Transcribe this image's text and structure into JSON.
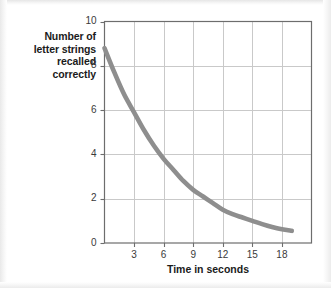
{
  "figure": {
    "y_axis_caption_lines": [
      "Number of",
      "letter strings",
      "recalled",
      "correctly"
    ],
    "x_axis_title": "Time in seconds"
  },
  "chart_data": {
    "type": "line",
    "title": "",
    "subtitle": "",
    "xlabel": "Time in seconds",
    "ylabel": "Number of letter strings recalled correctly",
    "xlim": [
      0,
      21
    ],
    "ylim": [
      0,
      10
    ],
    "xticks": [
      3,
      6,
      9,
      12,
      15,
      18
    ],
    "xtick_labels": [
      "3",
      "6",
      "9",
      "12",
      "15",
      "18"
    ],
    "yticks": [
      0,
      2,
      4,
      6,
      8,
      10
    ],
    "ytick_labels": [
      "0",
      "2",
      "4",
      "6",
      "8",
      "10"
    ],
    "grid": true,
    "grid_color": "#c9c9c9",
    "legend": "none",
    "line_color": "#8e8e8e",
    "line_width": 4.6,
    "series": [
      {
        "name": "Letter strings recalled",
        "x": [
          0,
          1,
          2,
          3,
          4,
          5,
          6,
          7,
          8,
          9,
          10,
          11,
          12,
          13,
          14,
          15,
          16,
          17,
          18,
          19
        ],
        "y": [
          8.8,
          7.7,
          6.7,
          5.9,
          5.1,
          4.4,
          3.8,
          3.3,
          2.8,
          2.4,
          2.1,
          1.8,
          1.5,
          1.3,
          1.15,
          1.0,
          0.85,
          0.72,
          0.62,
          0.55
        ]
      }
    ],
    "annotations": []
  }
}
